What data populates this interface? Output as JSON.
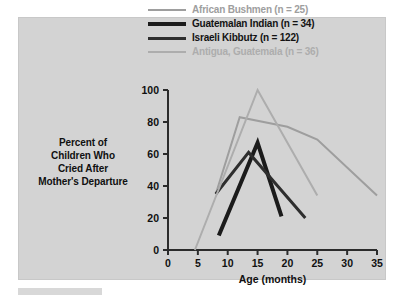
{
  "chart_data": {
    "type": "line",
    "title": "",
    "xlabel": "Age (months)",
    "ylabel": "Percent of Children Who Cried After Mother's Departure",
    "ylabel_lines": [
      "Percent of",
      "Children Who",
      "Cried After",
      "Mother's Departure"
    ],
    "xlim": [
      0,
      35
    ],
    "ylim": [
      0,
      100
    ],
    "xticks": [
      0,
      5,
      10,
      15,
      20,
      25,
      30,
      35
    ],
    "yticks": [
      0,
      20,
      40,
      60,
      80,
      100
    ],
    "grid": false,
    "legend_position": "top",
    "series": [
      {
        "name": "African Bushmen (n = 25)",
        "label": "African Bushmen (n = 25)",
        "color": "#9e9e9e",
        "width": 2,
        "x": [
          8,
          12,
          20,
          25,
          35
        ],
        "values": [
          35,
          83,
          77,
          69,
          34
        ]
      },
      {
        "name": "Guatemalan Indian (n = 34)",
        "label": "Guatemalan Indian (n = 34)",
        "color": "#1b1b1b",
        "width": 4,
        "x": [
          8.5,
          15,
          19
        ],
        "values": [
          9,
          67,
          21
        ]
      },
      {
        "name": "Israeli Kibbutz (n = 122)",
        "label": "Israeli Kibbutz (n = 122)",
        "color": "#2e2e2e",
        "width": 3,
        "x": [
          8,
          13.5,
          23
        ],
        "values": [
          35,
          61,
          20
        ]
      },
      {
        "name": "Antigua, Guatemala (n = 36)",
        "label": "Antigua, Guatemala (n = 36)",
        "color": "#adadad",
        "width": 2,
        "x": [
          4.5,
          15,
          25
        ],
        "values": [
          0,
          100,
          34
        ]
      }
    ]
  },
  "legend": {
    "items": [
      {
        "label": "African Bushmen (n = 25)"
      },
      {
        "label": "Guatemalan Indian (n = 34)"
      },
      {
        "label": "Israeli Kibbutz (n = 122)"
      },
      {
        "label": "Antigua, Guatemala (n = 36)"
      }
    ]
  },
  "axes": {
    "x_title": "Age (months)",
    "x_ticks": [
      "0",
      "5",
      "10",
      "15",
      "20",
      "25",
      "30",
      "35"
    ],
    "y_ticks": [
      "0",
      "20",
      "40",
      "60",
      "80",
      "100"
    ],
    "y_title_lines": [
      "Percent of",
      "Children Who",
      "Cried After",
      "Mother's Departure"
    ]
  },
  "colors": {
    "card_background": "#d3d3d3",
    "page_background": "#ffffff",
    "axis": "#2b2b2b",
    "text": "#101010",
    "bushmen": "#9e9e9e",
    "guatemalan": "#1b1b1b",
    "kibbutz": "#2e2e2e",
    "antigua": "#adadad"
  }
}
